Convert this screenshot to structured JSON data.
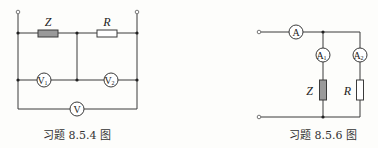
{
  "figures": [
    {
      "caption": "习题 8.5.4 图",
      "components": {
        "impedance_label": "Z",
        "resistor_label": "R",
        "voltmeter_1": {
          "main": "V",
          "sub": "1"
        },
        "voltmeter_2": {
          "main": "V",
          "sub": "2"
        },
        "voltmeter_total": {
          "main": "V",
          "sub": ""
        }
      }
    },
    {
      "caption": "习题 8.5.6 图",
      "components": {
        "ammeter_total": {
          "main": "A",
          "sub": ""
        },
        "ammeter_1": {
          "main": "A",
          "sub": "1"
        },
        "ammeter_2": {
          "main": "A",
          "sub": "2"
        },
        "impedance_label": "Z",
        "resistor_label": "R"
      }
    }
  ],
  "colors": {
    "impedance_fill": "#9a9a9a",
    "resistor_fill": "#ffffff",
    "wire": "#3a3a3a"
  }
}
